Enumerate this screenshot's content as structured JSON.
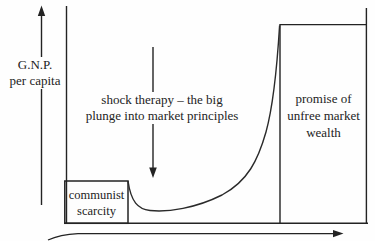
{
  "figure": {
    "y_axis_label": {
      "line1": "G.N.P.",
      "line2": "per capita"
    },
    "shock_annotation": {
      "line1": "shock therapy – the big",
      "line2": "plunge into market principles"
    },
    "communist_box": {
      "line1": "communist",
      "line2": "scarcity"
    },
    "promise_box": {
      "line1": "promise of",
      "line2": "unfree market",
      "line3": "wealth"
    },
    "colors": {
      "ink": "#232323",
      "background": "#fefefe"
    }
  }
}
